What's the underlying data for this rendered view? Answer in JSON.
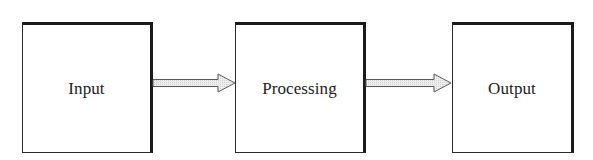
{
  "diagram": {
    "type": "flowchart",
    "direction": "left-to-right",
    "nodes": [
      {
        "id": "input",
        "label": "Input"
      },
      {
        "id": "processing",
        "label": "Processing"
      },
      {
        "id": "output",
        "label": "Output"
      }
    ],
    "edges": [
      {
        "from": "input",
        "to": "processing",
        "style": "hollow-block-arrow"
      },
      {
        "from": "processing",
        "to": "output",
        "style": "hollow-block-arrow"
      }
    ],
    "colors": {
      "border": "#1a1a1a",
      "arrow_outline": "#555555",
      "arrow_fill": "#e6e6e6",
      "background": "#ffffff",
      "text": "#222222"
    }
  }
}
